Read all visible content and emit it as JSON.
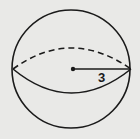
{
  "figure": {
    "shape": "sphere",
    "radius_label": "3",
    "colors": {
      "background": "#e9e9e7",
      "stroke": "#1a1a1a"
    }
  }
}
